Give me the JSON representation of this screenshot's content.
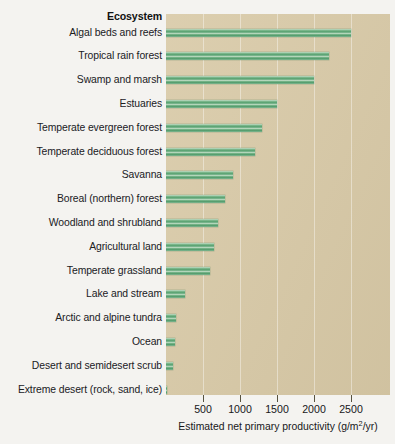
{
  "header": {
    "category_header": "Ecosystem"
  },
  "axis": {
    "x_title_main": "Estimated net primary productivity (g/m",
    "x_title_sup": "2",
    "x_title_tail": "/yr)",
    "x_title_full": "Estimated net primary productivity (g/m2/yr)",
    "ticks": [
      "500",
      "1000",
      "1500",
      "2000",
      "2500"
    ]
  },
  "colors": {
    "panel_background": "#d8c9a6",
    "figure_background": "#f4f3f0",
    "bar_green": "#4f9c6a",
    "bar_highlight": "#bfdcc4",
    "gridline": "#ffffff",
    "text": "#17171a"
  },
  "chart_data": {
    "type": "bar",
    "orientation": "horizontal",
    "title": "",
    "xlabel": "Estimated net primary productivity (g/m2/yr)",
    "ylabel": "Ecosystem",
    "xlim": [
      0,
      3020
    ],
    "xticks": [
      500,
      1000,
      1500,
      2000,
      2500
    ],
    "grid": true,
    "legend": "none",
    "categories": [
      "Algal beds and reefs",
      "Tropical rain forest",
      "Swamp and marsh",
      "Estuaries",
      "Temperate evergreen forest",
      "Temperate deciduous forest",
      "Savanna",
      "Boreal (northern) forest",
      "Woodland and shrubland",
      "Agricultural land",
      "Temperate grassland",
      "Lake and stream",
      "Arctic and alpine tundra",
      "Ocean",
      "Desert and semidesert scrub",
      "Extreme desert (rock, sand, ice)"
    ],
    "values": [
      2500,
      2200,
      2000,
      1500,
      1300,
      1200,
      900,
      800,
      700,
      650,
      600,
      250,
      140,
      125,
      90,
      3
    ]
  }
}
